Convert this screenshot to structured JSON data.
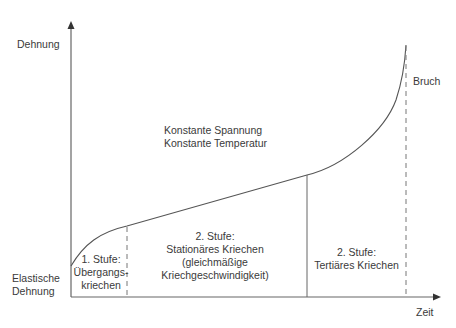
{
  "diagram": {
    "title_lines": [
      "Konstante Spannung",
      "Konstante Temperatur"
    ],
    "y_axis_label": "Dehnung",
    "x_axis_label": "Zeit",
    "origin_label_lines": [
      "Elastische",
      "Dehnung"
    ],
    "end_label": "Bruch",
    "stages": [
      {
        "lines": [
          "1. Stufe:",
          "Übergangs-",
          "kriechen"
        ]
      },
      {
        "lines": [
          "2. Stufe:",
          "Stationäres Kriechen",
          "(gleichmäßige",
          "Kriechgeschwindigkeit)"
        ]
      },
      {
        "lines": [
          "2. Stufe:",
          "Tertiäres Kriechen"
        ]
      }
    ],
    "colors": {
      "line": "#555555",
      "text": "#3a3a3a",
      "background": "#ffffff"
    }
  }
}
